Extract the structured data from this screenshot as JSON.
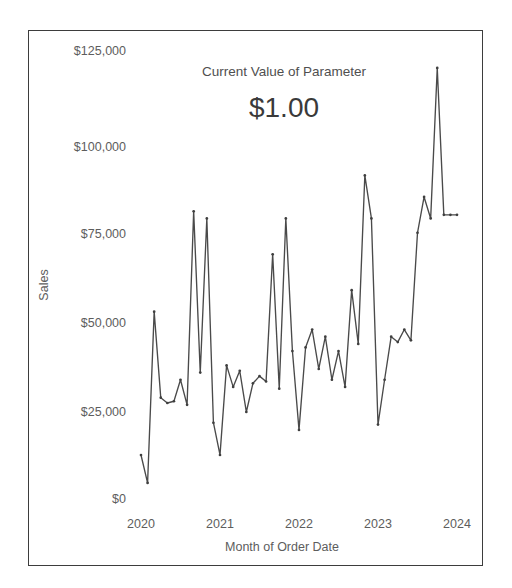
{
  "frame": {
    "border_color": "#3d3d3d",
    "background": "#ffffff"
  },
  "annotation": {
    "caption": "Current Value of Parameter",
    "value": "$1.00"
  },
  "chart_data": {
    "type": "line",
    "title": "Current Value of Parameter",
    "subtitle": "$1.00",
    "xlabel": "Month of Order Date",
    "ylabel": "Sales",
    "ylim": [
      0,
      125000
    ],
    "xlim": [
      "2020",
      "2024"
    ],
    "grid": false,
    "legend": "none",
    "line_color": "#4a4a4a",
    "marker": "dot",
    "ytick_labels": [
      "$0",
      "$25,000",
      "$50,000",
      "$75,000",
      "$100,000",
      "$125,000"
    ],
    "ytick_values": [
      0,
      25000,
      50000,
      75000,
      100000,
      125000
    ],
    "xtick_labels": [
      "2020",
      "2021",
      "2022",
      "2023",
      "2024"
    ],
    "xtick_values": [
      2020,
      2021,
      2022,
      2023,
      2024
    ],
    "x": [
      "2020-01",
      "2020-02",
      "2020-03",
      "2020-04",
      "2020-05",
      "2020-06",
      "2020-07",
      "2020-08",
      "2020-09",
      "2020-10",
      "2020-11",
      "2020-12",
      "2021-01",
      "2021-02",
      "2021-03",
      "2021-04",
      "2021-05",
      "2021-06",
      "2021-07",
      "2021-08",
      "2021-09",
      "2021-10",
      "2021-11",
      "2021-12",
      "2022-01",
      "2022-02",
      "2022-03",
      "2022-04",
      "2022-05",
      "2022-06",
      "2022-07",
      "2022-08",
      "2022-09",
      "2022-10",
      "2022-11",
      "2022-12",
      "2023-01",
      "2023-02",
      "2023-03",
      "2023-04",
      "2023-05",
      "2023-06",
      "2023-07",
      "2023-08",
      "2023-09",
      "2023-10",
      "2023-11",
      "2023-12",
      "2024-01"
    ],
    "values": [
      12000,
      4200,
      52000,
      28000,
      26500,
      27000,
      33000,
      26000,
      80000,
      35000,
      78000,
      21000,
      12000,
      37000,
      31000,
      35500,
      24000,
      32000,
      34000,
      32500,
      68000,
      30500,
      78000,
      41000,
      19000,
      42000,
      47000,
      36000,
      45000,
      33000,
      41000,
      31000,
      58000,
      43000,
      90000,
      78000,
      20500,
      33000,
      45000,
      43500,
      47000,
      44000,
      74000,
      84000,
      78000,
      120000,
      79000,
      79000,
      79000
    ],
    "series": [
      {
        "name": "Sales",
        "values": [
          12000,
          4200,
          52000,
          28000,
          26500,
          27000,
          33000,
          26000,
          80000,
          35000,
          78000,
          21000,
          12000,
          37000,
          31000,
          35500,
          24000,
          32000,
          34000,
          32500,
          68000,
          30500,
          78000,
          41000,
          19000,
          42000,
          47000,
          36000,
          45000,
          33000,
          41000,
          31000,
          58000,
          43000,
          90000,
          78000,
          20500,
          33000,
          45000,
          43500,
          47000,
          44000,
          74000,
          84000,
          78000,
          120000,
          79000,
          79000,
          79000
        ]
      }
    ]
  }
}
